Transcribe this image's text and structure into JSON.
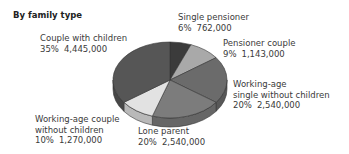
{
  "header": {
    "title": "By family type"
  },
  "chart_data": {
    "type": "pie",
    "title": "By family type",
    "style": "3d",
    "slices": [
      {
        "label": "Single pensioner",
        "percent": 6,
        "value": 762000,
        "value_text": "762,000",
        "pct_text": "6%",
        "color": "#3b3b3b"
      },
      {
        "label": "Pensioner couple",
        "percent": 9,
        "value": 1143000,
        "value_text": "1,143,000",
        "pct_text": "9%",
        "color": "#a9a9a9"
      },
      {
        "label": "Working-age single without children",
        "percent": 20,
        "value": 2540000,
        "value_text": "2,540,000",
        "pct_text": "20%",
        "color": "#6b6b6b"
      },
      {
        "label": "Lone parent",
        "percent": 20,
        "value": 2540000,
        "value_text": "2,540,000",
        "pct_text": "20%",
        "color": "#7c7c7c"
      },
      {
        "label": "Working-age couple without children",
        "percent": 10,
        "value": 1270000,
        "value_text": "1,270,000",
        "pct_text": "10%",
        "color": "#e2e2e2"
      },
      {
        "label": "Couple with children",
        "percent": 35,
        "value": 4445000,
        "value_text": "4,445,000",
        "pct_text": "35%",
        "color": "#565656"
      }
    ]
  },
  "labels": {
    "single_pensioner": {
      "line1": "Single pensioner",
      "pct": "6%",
      "value": "762,000"
    },
    "pensioner_couple": {
      "line1": "Pensioner couple",
      "pct": "9%",
      "value": "1,143,000"
    },
    "working_single": {
      "line1": "Working-age",
      "line2": "single without children",
      "pct": "20%",
      "value": "2,540,000"
    },
    "lone_parent": {
      "line1": "Lone parent",
      "pct": "20%",
      "value": "2,540,000"
    },
    "working_couple": {
      "line1": "Working-age couple",
      "line2": "without children",
      "pct": "10%",
      "value": "1,270,000"
    },
    "couple_children": {
      "line1": "Couple with children",
      "pct": "35%",
      "value": "4,445,000"
    }
  }
}
